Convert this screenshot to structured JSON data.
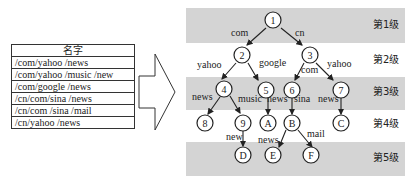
{
  "table": {
    "header": "名字",
    "rows": [
      "/com/yahoo /news",
      "/com/yahoo /music /new",
      "/com/google /news",
      "/cn/com/sina /news",
      "/cn/com /sina /mail",
      "/cn/yahoo /news"
    ]
  },
  "levels": [
    "第1级",
    "第2级",
    "第3级",
    "第4级",
    "第5级"
  ],
  "nodes": {
    "n1": "1",
    "n2": "2",
    "n3": "3",
    "n4": "4",
    "n5": "5",
    "n6": "6",
    "n7": "7",
    "n8": "8",
    "n9": "9",
    "nA": "A",
    "nB": "B",
    "nC": "C",
    "nD": "D",
    "nE": "E",
    "nF": "F"
  },
  "edges": {
    "e1_2": "com",
    "e1_3": "cn",
    "e2_4": "yahoo",
    "e2_5": "google",
    "e3_6": "com",
    "e3_7": "yahoo",
    "e4_8": "news",
    "e4_9": "music",
    "e5_A": "news",
    "e6_B": "sina",
    "e7_C": "news",
    "e9_D": "new",
    "eB_E": "news",
    "eB_F": "mail"
  },
  "colors": {
    "band": "#d4d4d4",
    "line": "#222222"
  }
}
